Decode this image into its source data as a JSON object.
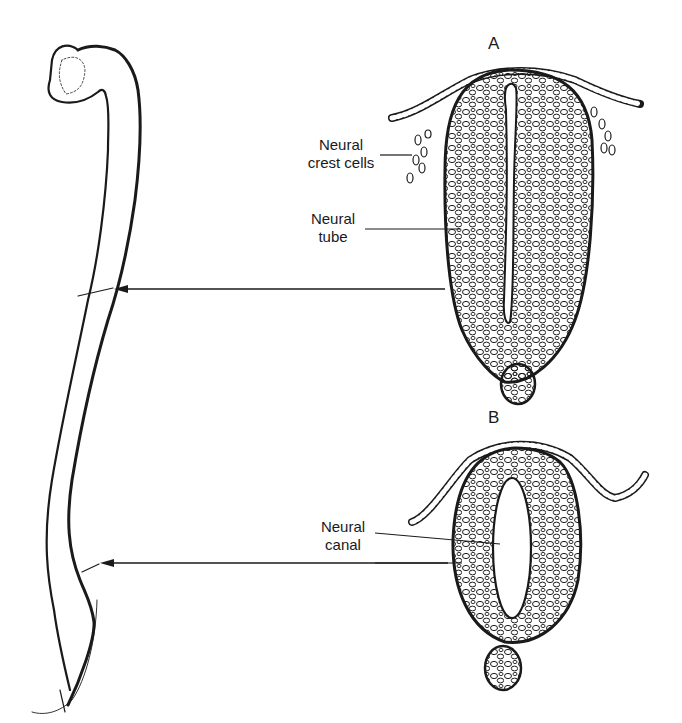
{
  "figure": {
    "panels": [
      {
        "id": "A",
        "letter": "A",
        "labels": [
          "Neural crest cells",
          "Neural tube"
        ]
      },
      {
        "id": "B",
        "letter": "B",
        "labels": [
          "Neural canal"
        ]
      }
    ],
    "labels": {
      "neural_crest_line1": "Neural",
      "neural_crest_line2": "crest cells",
      "neural_tube_line1": "Neural",
      "neural_tube_line2": "tube",
      "neural_canal_line1": "Neural",
      "neural_canal_line2": "canal"
    },
    "panel_letters": {
      "a": "A",
      "b": "B"
    },
    "colors": {
      "ink": "#1a1a1a",
      "background": "#ffffff"
    }
  }
}
